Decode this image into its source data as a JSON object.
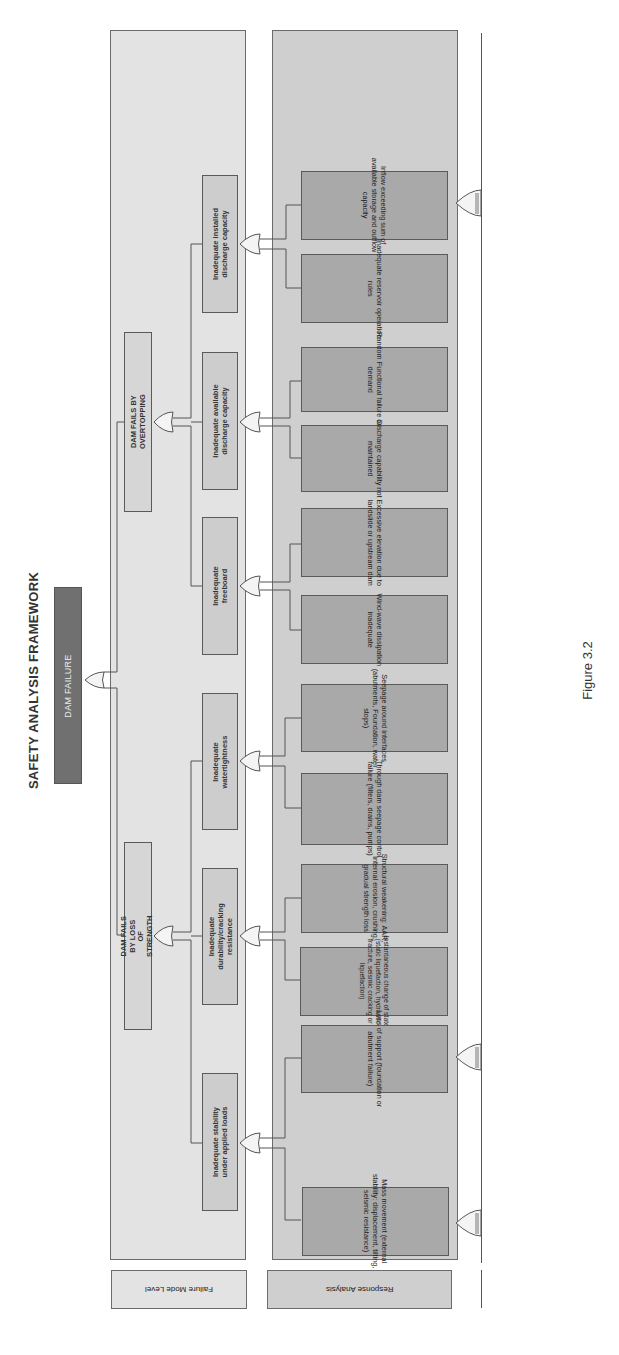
{
  "title": "SAFETY ANALYSIS FRAMEWORK",
  "top_event": "DAM FAILURE",
  "caption": "Figure 3.2",
  "panels": {
    "failure_mode": {
      "label": "Failure Mode Level",
      "fill": "#e3e3e3"
    },
    "response": {
      "label": "Response Analysis",
      "fill": "#cfcfcf"
    }
  },
  "gates": {
    "type": "OR",
    "count": 11
  },
  "level1": [
    {
      "label": "DAM FAILS BY OVERTOPPING"
    },
    {
      "label": "DAM FAILS BY LOSS OF STRENGTH"
    }
  ],
  "level2": [
    {
      "label": "Inadequate installed\ndischarge capacity",
      "parent": "DAM FAILS BY OVERTOPPING"
    },
    {
      "label": "Inadequate available\ndischarge capacity",
      "parent": "DAM FAILS BY OVERTOPPING"
    },
    {
      "label": "Inadequate\nfreeboard",
      "parent": "DAM FAILS BY OVERTOPPING"
    },
    {
      "label": "Inadequate\nwatertightness",
      "parent": "DAM FAILS BY LOSS OF STRENGTH"
    },
    {
      "label": "Inadequate\ndurability/cracking\nresistance",
      "parent": "DAM FAILS BY LOSS OF STRENGTH"
    },
    {
      "label": "Inadequate stability\nunder applied loads",
      "parent": "DAM FAILS BY LOSS OF STRENGTH"
    }
  ],
  "leaves": [
    {
      "label": "Inflow exceeding sum of\navailable storage and outflow\ncapacity"
    },
    {
      "label": "Inadequate reservoir operation\nrules"
    },
    {
      "label": "Random Functional failure on\ndemand"
    },
    {
      "label": "Discharge capability not\nmaintained"
    },
    {
      "label": "Excessive elevation due to\nlandslide or upstream dam"
    },
    {
      "label": "Wind-wave dissipation\ninadequate"
    },
    {
      "label": "Seepage around interfaces\n(abutments, Foundation, water\nstops)"
    },
    {
      "label": "Through dam seepage control\nfailure (filters, drains, pumps)"
    },
    {
      "label": "Structural weakening: AAR,\ninternal erosion, crushing,\ngradual strength loss"
    },
    {
      "label": "Instantaneous change of state\n(static liquefaction, hydraulic\nfracture, seismic cracking or\nliquefaction)"
    },
    {
      "label": "Loss of support (foundation or\nabutment failure)"
    },
    {
      "label": "Mass movement (external\nstability: displacement, tilting,\nseismic resistance)"
    }
  ]
}
